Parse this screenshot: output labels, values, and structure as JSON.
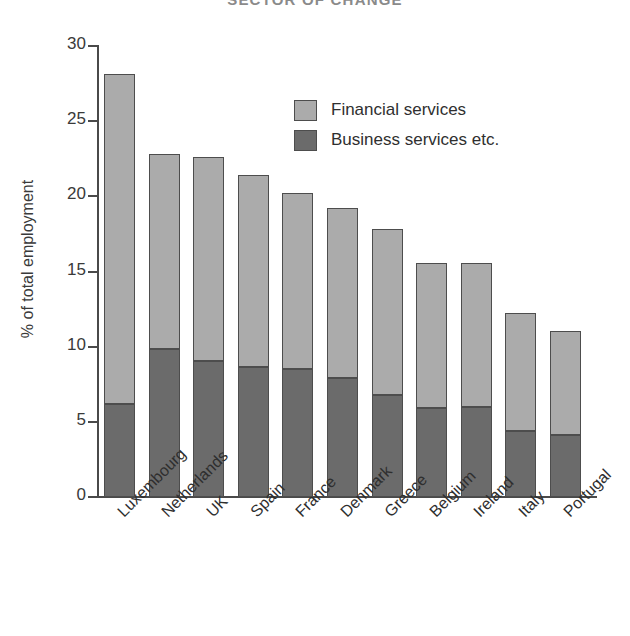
{
  "chart_data": {
    "type": "bar",
    "subtype": "stacked-vertical",
    "title": "SECTOR OF CHANGE",
    "xlabel": "",
    "ylabel": "% of total employment",
    "ylim": [
      0,
      30
    ],
    "yticks": [
      0,
      5,
      10,
      15,
      20,
      25,
      30
    ],
    "ytick_labels": [
      "0",
      "5",
      "10",
      "15",
      "20",
      "25",
      "30"
    ],
    "grid": false,
    "legend_position": "upper-center",
    "categories": [
      "Luxembourg",
      "Netherlands",
      "UK",
      "Spain",
      "France",
      "Denmark",
      "Greece",
      "Belgium",
      "Ireland",
      "Italy",
      "Portugal"
    ],
    "series": [
      {
        "name": "Business services etc.",
        "color": "#6b6b6b",
        "values": [
          6.2,
          9.8,
          9.0,
          8.6,
          8.5,
          7.9,
          6.8,
          5.9,
          6.0,
          4.4,
          4.1
        ]
      },
      {
        "name": "Financial services",
        "color": "#ababab",
        "values": [
          21.9,
          13.0,
          13.6,
          12.8,
          11.7,
          11.3,
          11.0,
          9.6,
          9.5,
          7.8,
          6.9
        ]
      }
    ],
    "totals": [
      28.1,
      22.8,
      22.6,
      21.4,
      20.2,
      19.2,
      17.8,
      15.5,
      15.5,
      12.2,
      11.0
    ]
  },
  "legend": {
    "entries": [
      {
        "label": "Financial services",
        "swatch": "light"
      },
      {
        "label": "Business services etc.",
        "swatch": "dark"
      }
    ]
  },
  "colors": {
    "light_gray": "#ababab",
    "dark_gray": "#6b6b6b",
    "outline": "#4d4d4d",
    "background": "#ffffff"
  }
}
